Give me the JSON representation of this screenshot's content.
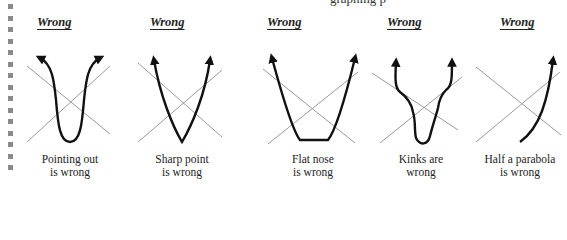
{
  "top_fragment": "graphing p",
  "panels": [
    {
      "header": "Wrong",
      "caption_line1": "Pointing out",
      "caption_line2": "is wrong"
    },
    {
      "header": "Wrong",
      "caption_line1": "Sharp point",
      "caption_line2": "is wrong"
    },
    {
      "header": "Wrong",
      "caption_line1": "Flat nose",
      "caption_line2": "is wrong"
    },
    {
      "header": "Wrong",
      "caption_line1": "Kinks are",
      "caption_line2": "wrong"
    },
    {
      "header": "Wrong",
      "caption_line1": "Half a parabola",
      "caption_line2": "is wrong"
    }
  ],
  "colors": {
    "curve": "#111111",
    "asymptote": "#9a9a9a",
    "margin_dot": "#8a8a8a"
  }
}
